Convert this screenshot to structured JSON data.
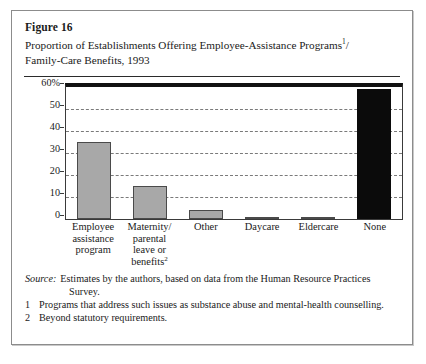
{
  "figure": {
    "number": "Figure 16",
    "caption_line1_pre": "Proportion of Establishments Offering Employee-Assistance Programs",
    "caption_sup": "1",
    "caption_line1_post": "/",
    "caption_line2": "Family-Care Benefits, 1993"
  },
  "notes": {
    "source_word": "Source:",
    "source_text": "Estimates by the authors, based on data from the Human Resource Practices Survey.",
    "footnotes": [
      {
        "num": "1",
        "text": "Programs that address such issues as substance abuse and mental-health counselling."
      },
      {
        "num": "2",
        "text": "Beyond statutory requirements."
      }
    ]
  },
  "chart_data": {
    "type": "bar",
    "xlabel": "",
    "ylabel": "",
    "ylim": [
      0,
      60
    ],
    "grid": true,
    "legend": "none",
    "categories": [
      "Employee assistance program",
      "Maternity/ parental leave or benefits",
      "Other",
      "Daycare",
      "Eldercare",
      "None"
    ],
    "category_labels": [
      {
        "lines": [
          "Employee",
          "assistance",
          "program"
        ],
        "sup": ""
      },
      {
        "lines": [
          "Maternity/",
          "parental",
          "leave or",
          "benefits"
        ],
        "sup": "2"
      },
      {
        "lines": [
          "Other"
        ],
        "sup": ""
      },
      {
        "lines": [
          "Daycare"
        ],
        "sup": ""
      },
      {
        "lines": [
          "Eldercare"
        ],
        "sup": ""
      },
      {
        "lines": [
          "None"
        ],
        "sup": ""
      }
    ],
    "values": [
      35,
      15,
      4,
      1,
      0.4,
      59
    ],
    "bar_colors": [
      "#a8a8a8",
      "#a8a8a8",
      "#a8a8a8",
      "#a8a8a8",
      "#a8a8a8",
      "#0b0b0b"
    ],
    "yticks": [
      {
        "value": 60,
        "label": "60%"
      },
      {
        "value": 50,
        "label": "50"
      },
      {
        "value": 40,
        "label": "40"
      },
      {
        "value": 30,
        "label": "30"
      },
      {
        "value": 20,
        "label": "20"
      },
      {
        "value": 10,
        "label": "10"
      },
      {
        "value": 0,
        "label": "0"
      }
    ]
  }
}
